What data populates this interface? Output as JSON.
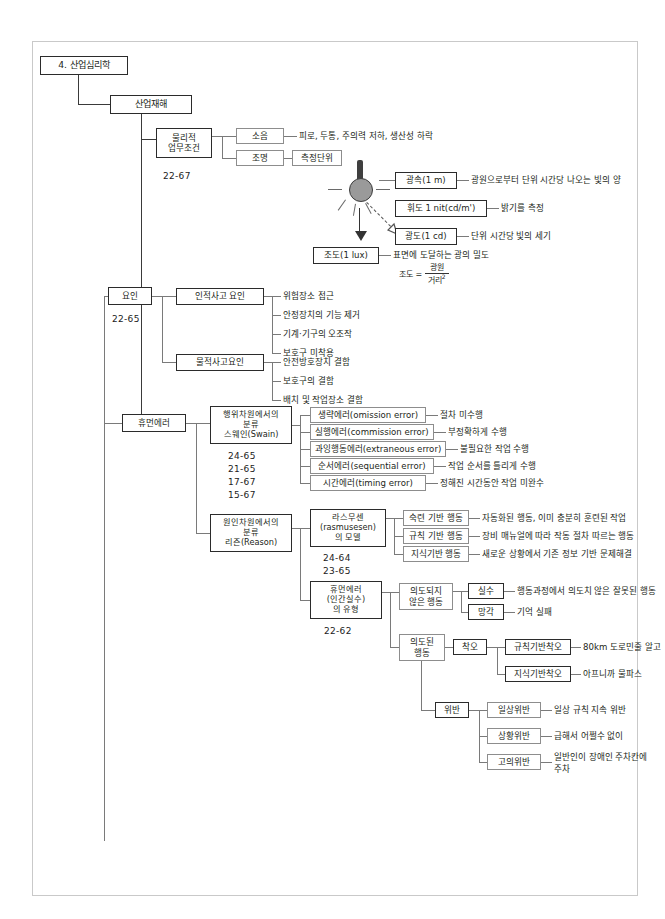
{
  "page": {
    "header_faint": "",
    "title_box": "4. 산업심리학",
    "root": "산업재해"
  },
  "physical": {
    "label": "물리적\n업무조건",
    "ref": "22-67",
    "children": [
      {
        "label": "소음",
        "desc": "피로, 두통, 주의력 저하, 생산성 하락"
      },
      {
        "label": "조명",
        "desc": "측정단위"
      }
    ]
  },
  "light": {
    "icon": "lamp-icon",
    "items": [
      {
        "label": "광속(1 m)",
        "desc": "광원으로부터 단위 시간당 나오는 빛의 양"
      },
      {
        "label": "휘도 1 nit(cd/m')",
        "desc": "밝기를 측정"
      },
      {
        "label": "광도(1 cd)",
        "desc": "단위 시간당 빛의 세기"
      }
    ],
    "illuminance": {
      "label": "조도(1 lux)",
      "desc": "표면에 도달하는 광의 밀도",
      "formula_lhs": "조도 =",
      "formula_num": "광원",
      "formula_den": "거리",
      "formula_den_exp": "2"
    }
  },
  "factor": {
    "label": "요인",
    "ref": "22-65",
    "groups": [
      {
        "label": "인적사고 요인",
        "items": [
          "위험장소 접근",
          "안정장치의 기능 제거",
          "기계·기구의 오조작",
          "보호구 미착용"
        ]
      },
      {
        "label": "물적사고요인",
        "items": [
          "안전방호장치 결함",
          "보호구의 결함",
          "배치 및 작업장소 결함"
        ]
      }
    ]
  },
  "human_error": {
    "label": "휴먼에러",
    "swain": {
      "label": "행위차원에서의\n분류\n스웨인(Swain)",
      "ref": "24-65\n21-65\n17-67\n15-67",
      "items": [
        {
          "label": "생략에러(omission error)",
          "desc": "절차 미수행"
        },
        {
          "label": "실행에러(commission error)",
          "desc": "부정확하게 수행"
        },
        {
          "label": "과잉행동에러(extraneous error)",
          "desc": "불필요한 작업 수행"
        },
        {
          "label": "순서에러(sequential error)",
          "desc": "작업 순서를 틀리게 수행"
        },
        {
          "label": "시간에러(timing error)",
          "desc": "정해진 시간동안 작업 미완수"
        }
      ]
    },
    "reason": {
      "label": "원인차원에서의\n분류\n리즌(Reason)",
      "rasmussen": {
        "label": "라스무센\n(rasmusesen)\n의 모델",
        "ref": "24-64\n23-65",
        "items": [
          {
            "label": "숙련 기반 행동",
            "desc": "자동화된 행동, 이미 충분히 훈련된 작업"
          },
          {
            "label": "규칙 기반 행동",
            "desc": "장비 매뉴얼에 따라 작동 절차 따르는 행동"
          },
          {
            "label": "지식기반 행동",
            "desc": "새로운 상황에서 기존 정보 기반 문제해결"
          }
        ]
      },
      "types": {
        "label": "휴먼에러\n(인간실수)\n의 유형",
        "ref": "22-62",
        "unintended": {
          "label": "의도되지\n않은 행동",
          "items": [
            {
              "label": "실수",
              "desc": "행동과정에서 의도치 않은 잘못된 행동"
            },
            {
              "label": "망각",
              "desc": "기억 실패"
            }
          ]
        },
        "intended": {
          "label": "의도된\n행동",
          "mistake": {
            "label": "착오",
            "items": [
              {
                "label": "규칙기반착오",
                "desc": "80km 도로민줄 알고"
              },
              {
                "label": "지식기반착오",
                "desc": "아프니까 물파스"
              }
            ]
          },
          "violation": {
            "label": "위반",
            "items": [
              {
                "label": "일상위반",
                "desc": "일상 규칙 지속 위반"
              },
              {
                "label": "상황위반",
                "desc": "급해서 어쩔수 없이"
              },
              {
                "label": "고의위반",
                "desc": "일반인이 장애인 주차칸에\n주차"
              }
            ]
          }
        }
      }
    }
  }
}
